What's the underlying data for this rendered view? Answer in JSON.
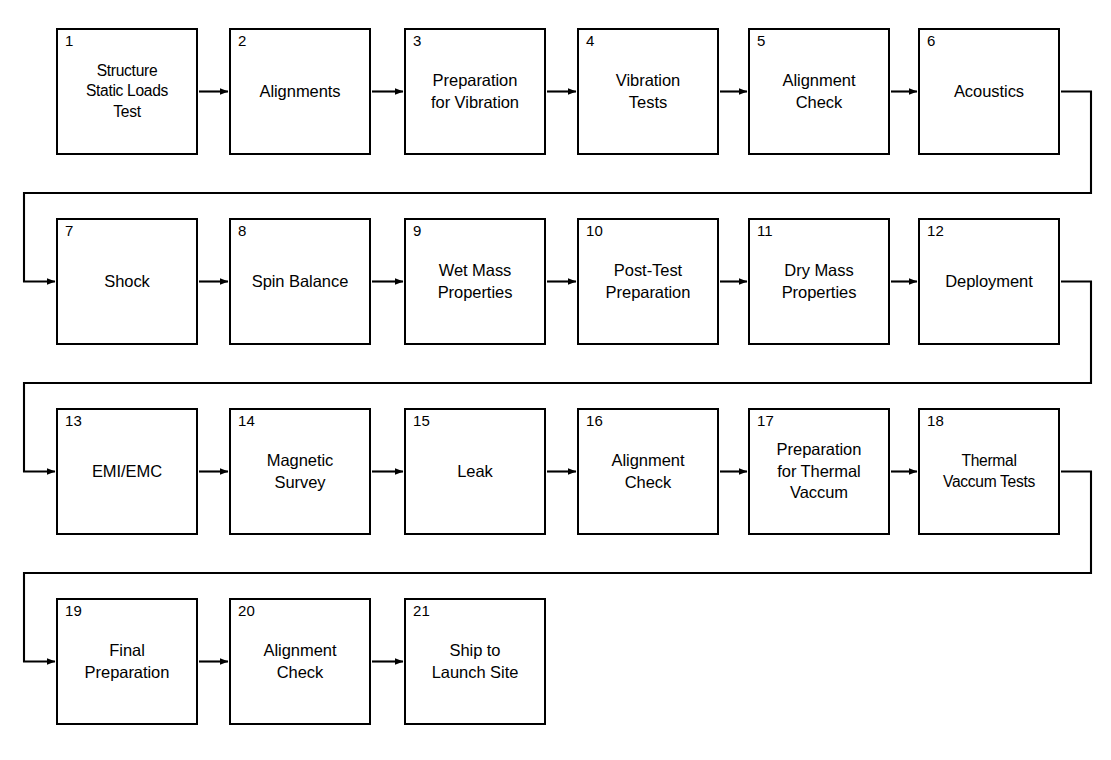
{
  "diagram": {
    "shape": "rectangle",
    "line_color": "#000000",
    "fill_color": "#ffffff",
    "background": "#ffffff",
    "arrow_style": "solid-line-filled-head",
    "flow_direction": "left-to-right, wrapping to next row",
    "node_count": 21,
    "row_count": 4
  },
  "nodes": [
    {
      "num": "1",
      "label": "Structure\nStatic Loads\nTest",
      "row": 1,
      "col": 1
    },
    {
      "num": "2",
      "label": "Alignments",
      "row": 1,
      "col": 2
    },
    {
      "num": "3",
      "label": "Preparation\nfor Vibration",
      "row": 1,
      "col": 3
    },
    {
      "num": "4",
      "label": "Vibration\nTests",
      "row": 1,
      "col": 4
    },
    {
      "num": "5",
      "label": "Alignment\nCheck",
      "row": 1,
      "col": 5
    },
    {
      "num": "6",
      "label": "Acoustics",
      "row": 1,
      "col": 6
    },
    {
      "num": "7",
      "label": "Shock",
      "row": 2,
      "col": 1
    },
    {
      "num": "8",
      "label": "Spin Balance",
      "row": 2,
      "col": 2
    },
    {
      "num": "9",
      "label": "Wet Mass\nProperties",
      "row": 2,
      "col": 3
    },
    {
      "num": "10",
      "label": "Post-Test\nPreparation",
      "row": 2,
      "col": 4
    },
    {
      "num": "11",
      "label": "Dry Mass\nProperties",
      "row": 2,
      "col": 5
    },
    {
      "num": "12",
      "label": "Deployment",
      "row": 2,
      "col": 6
    },
    {
      "num": "13",
      "label": "EMI/EMC",
      "row": 3,
      "col": 1
    },
    {
      "num": "14",
      "label": "Magnetic\nSurvey",
      "row": 3,
      "col": 2
    },
    {
      "num": "15",
      "label": "Leak",
      "row": 3,
      "col": 3
    },
    {
      "num": "16",
      "label": "Alignment\nCheck",
      "row": 3,
      "col": 4
    },
    {
      "num": "17",
      "label": "Preparation\nfor Thermal\nVaccum",
      "row": 3,
      "col": 5
    },
    {
      "num": "18",
      "label": "Thermal\nVaccum Tests",
      "row": 3,
      "col": 6
    },
    {
      "num": "19",
      "label": "Final\nPreparation",
      "row": 4,
      "col": 1
    },
    {
      "num": "20",
      "label": "Alignment\nCheck",
      "row": 4,
      "col": 2
    },
    {
      "num": "21",
      "label": "Ship to\nLaunch Site",
      "row": 4,
      "col": 3
    }
  ],
  "connectors": {
    "inline_arrow_count": 17,
    "wrap_arrow_count": 3,
    "wrap_from": [
      "6",
      "12",
      "18"
    ],
    "wrap_to": [
      "7",
      "13",
      "19"
    ]
  }
}
